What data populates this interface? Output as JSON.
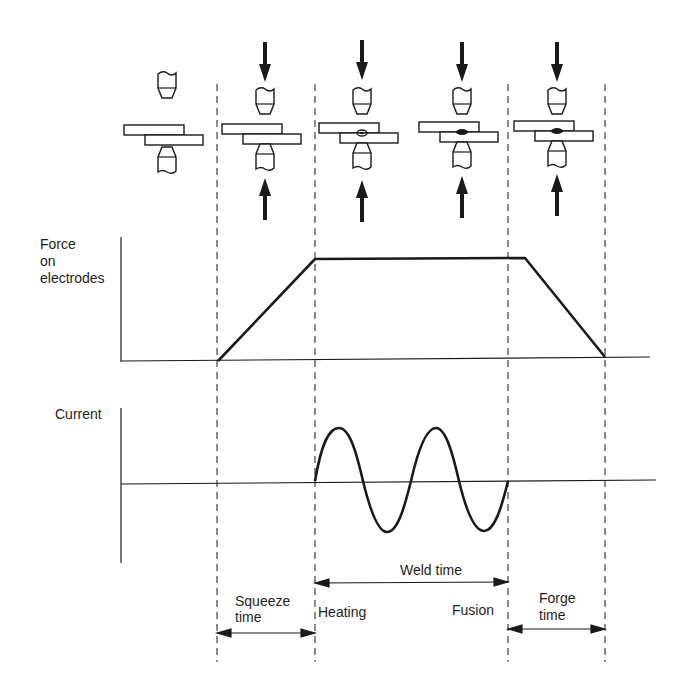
{
  "diagram": {
    "type": "timing-diagram",
    "stages": [
      {
        "name": "open",
        "force_arrows": false,
        "nugget": "none"
      },
      {
        "name": "squeeze",
        "force_arrows": true,
        "nugget": "none"
      },
      {
        "name": "heating",
        "force_arrows": true,
        "nugget": "small-forming"
      },
      {
        "name": "fusion",
        "force_arrows": true,
        "nugget": "solid"
      },
      {
        "name": "forge",
        "force_arrows": true,
        "nugget": "solid"
      }
    ],
    "traces": {
      "force": {
        "label_lines": [
          "Force",
          "on",
          "electrodes"
        ],
        "shape": "trapezoid",
        "points": [
          [
            218,
            361
          ],
          [
            315,
            259
          ],
          [
            525,
            258
          ],
          [
            605,
            357
          ]
        ]
      },
      "current": {
        "label": "Current",
        "shape": "sine",
        "cycles": 2,
        "start_x": 315,
        "end_x": 508
      }
    },
    "intervals": {
      "squeeze": {
        "lines": [
          "Squeeze",
          "time"
        ]
      },
      "weld": {
        "label": "Weld time",
        "start_label": "Heating",
        "end_label": "Fusion"
      },
      "forge": {
        "lines": [
          "Forge",
          "time"
        ]
      }
    },
    "colors": {
      "ink": "#1a1a1a",
      "background": "#ffffff"
    }
  }
}
